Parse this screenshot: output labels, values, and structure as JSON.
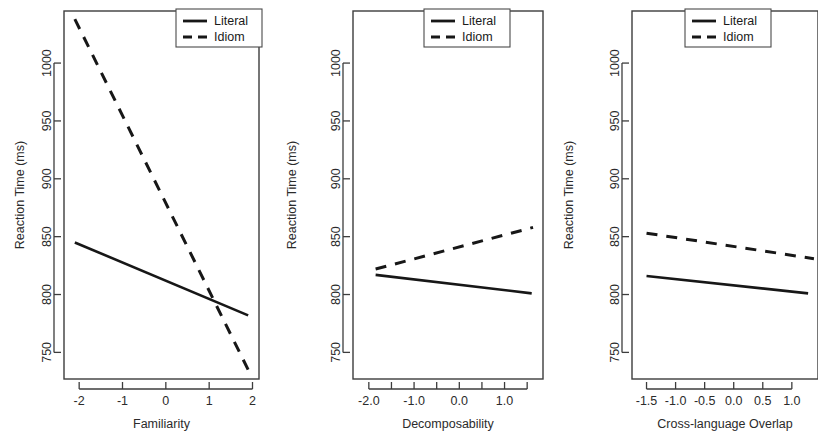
{
  "figure": {
    "background": "#ffffff",
    "line_color": "#171717",
    "axis_color": "#3d3d3d",
    "panel_count": 3
  },
  "chart_data": [
    {
      "type": "line",
      "title": "",
      "xlabel": "Familiarity",
      "ylabel": "Reaction Time (ms)",
      "xlim": [
        -2.35,
        2.15
      ],
      "ylim": [
        727,
        1045
      ],
      "xticks": [
        -2,
        -1,
        0,
        1,
        2
      ],
      "xticklabels": [
        "-2",
        "-1",
        "0",
        "1",
        "2"
      ],
      "yticks": [
        750,
        800,
        850,
        900,
        950,
        1000
      ],
      "yticklabels": [
        "750",
        "800",
        "850",
        "900",
        "950",
        "1000"
      ],
      "grid": false,
      "legend_position": "top-right",
      "series": [
        {
          "name": "Literal",
          "style": "solid",
          "x": [
            -2.1,
            1.9
          ],
          "values": [
            845,
            782
          ]
        },
        {
          "name": "Idiom",
          "style": "dashed",
          "x": [
            -2.1,
            1.9
          ],
          "values": [
            1038,
            735
          ]
        }
      ]
    },
    {
      "type": "line",
      "title": "",
      "xlabel": "Decomposability",
      "ylabel": "Reaction Time (ms)",
      "xlim": [
        -2.35,
        1.85
      ],
      "ylim": [
        727,
        1045
      ],
      "xticks": [
        -2.0,
        -1.5,
        -1.0,
        -0.5,
        0.0,
        0.5,
        1.0,
        1.5
      ],
      "xticklabels": [
        "-2.0",
        "",
        "-1.0",
        "",
        "0.0",
        "",
        "1.0",
        ""
      ],
      "yticks": [
        750,
        800,
        850,
        900,
        950,
        1000
      ],
      "yticklabels": [
        "750",
        "800",
        "850",
        "900",
        "950",
        "1000"
      ],
      "grid": false,
      "legend_position": "top-right",
      "series": [
        {
          "name": "Literal",
          "style": "solid",
          "x": [
            -1.85,
            1.6
          ],
          "values": [
            817,
            801
          ]
        },
        {
          "name": "Idiom",
          "style": "dashed",
          "x": [
            -1.85,
            1.63
          ],
          "values": [
            822,
            858
          ]
        }
      ]
    },
    {
      "type": "line",
      "title": "",
      "xlabel": "Cross-language Overlap",
      "ylabel": "Reaction Time (ms)",
      "xlim": [
        -1.75,
        1.45
      ],
      "ylim": [
        727,
        1045
      ],
      "xticks": [
        -1.5,
        -1.0,
        -0.5,
        0.0,
        0.5,
        1.0
      ],
      "xticklabels": [
        "-1.5",
        "-1.0",
        "-0.5",
        "0.0",
        "0.5",
        "1.0"
      ],
      "yticks": [
        750,
        800,
        850,
        900,
        950,
        1000
      ],
      "yticklabels": [
        "750",
        "800",
        "850",
        "900",
        "950",
        "1000"
      ],
      "grid": false,
      "legend_position": "top-right",
      "series": [
        {
          "name": "Literal",
          "style": "solid",
          "x": [
            -1.5,
            1.28
          ],
          "values": [
            816,
            801
          ]
        },
        {
          "name": "Idiom",
          "style": "dashed",
          "x": [
            -1.5,
            1.38
          ],
          "values": [
            853,
            831
          ]
        }
      ]
    }
  ],
  "legend": {
    "entries": [
      {
        "label": "Literal",
        "style": "solid"
      },
      {
        "label": "Idiom",
        "style": "dashed"
      }
    ]
  }
}
